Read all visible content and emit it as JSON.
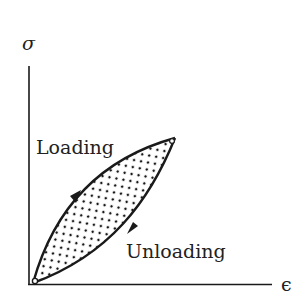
{
  "diagram": {
    "type": "stress-strain hysteresis loop",
    "axes": {
      "y_label": "σ",
      "x_label": "ϵ"
    },
    "curves": {
      "loading_label": "Loading",
      "unloading_label": "Unloading"
    },
    "colors": {
      "ink": "#1a1a1a",
      "background": "#ffffff"
    }
  }
}
